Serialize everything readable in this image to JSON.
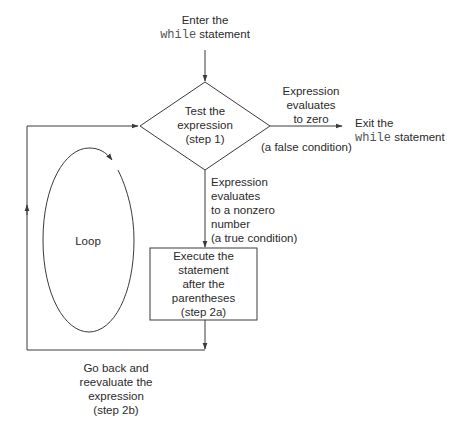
{
  "entry": {
    "line1": "Enter the",
    "code": "while",
    "line2_rest": " statement"
  },
  "decision": {
    "lines": [
      "Test the",
      "expression",
      "(step 1)"
    ]
  },
  "false_branch": {
    "label_lines": [
      "Expression",
      "evaluates",
      "to zero"
    ],
    "condition": "(a false condition)"
  },
  "exit": {
    "line1": "Exit the",
    "code": "while",
    "line2_rest": " statement"
  },
  "true_branch": {
    "label_lines": [
      "Expression",
      "evaluates",
      "to a nonzero",
      "number",
      "(a true condition)"
    ]
  },
  "process": {
    "lines": [
      "Execute the",
      "statement",
      "after the",
      "parentheses",
      "(step 2a)"
    ]
  },
  "loop": {
    "label": "Loop"
  },
  "return": {
    "lines": [
      "Go back and",
      "reevaluate the",
      "expression",
      "(step 2b)"
    ]
  },
  "colors": {
    "line": "#3a3a3a",
    "text": "#2a2a2a",
    "code": "#555555",
    "background": "#ffffff"
  }
}
